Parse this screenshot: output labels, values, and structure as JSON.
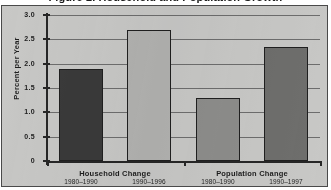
{
  "figure": {
    "title": "Figure 2. Household and Population Growth",
    "frame_color": "#c8c8c6",
    "border_color": "#4a4a4a"
  },
  "chart_data": {
    "type": "bar",
    "title": "Figure 2. Household and Population Growth",
    "xlabel": "",
    "ylabel": "Percent per Year",
    "ylim": [
      0,
      3.0
    ],
    "ytick_labels": [
      "3.0",
      "2.5",
      "2.0",
      "1.5",
      "1.0",
      "0.5",
      "0"
    ],
    "ytick_values": [
      3.0,
      2.5,
      2.0,
      1.5,
      1.0,
      0.5,
      0
    ],
    "grid": true,
    "legend": "none",
    "groups": [
      {
        "label": "Household Change",
        "bars": [
          {
            "period": "1980–1990",
            "value": 1.9,
            "color": "#3a3a3a"
          },
          {
            "period": "1990–1996",
            "value": 2.7,
            "color": "#b2b2b0"
          }
        ]
      },
      {
        "label": "Population Change",
        "bars": [
          {
            "period": "1980–1990",
            "value": 1.3,
            "color": "#8d8d8b"
          },
          {
            "period": "1990–1997",
            "value": 2.35,
            "color": "#6e6e6c"
          }
        ]
      }
    ],
    "categories": [
      "Household Change 1980–1990",
      "Household Change 1990–1996",
      "Population Change 1980–1990",
      "Population Change 1990–1997"
    ],
    "values": [
      1.9,
      2.7,
      1.3,
      2.35
    ]
  }
}
